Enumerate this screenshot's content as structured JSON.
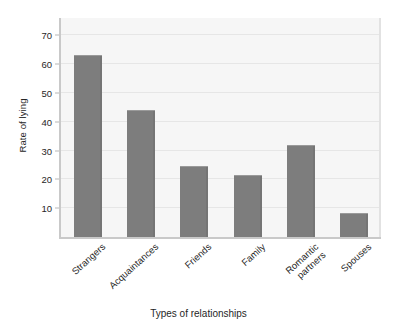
{
  "chart_data": {
    "type": "bar",
    "title": "",
    "subtitle": "",
    "xlabel": "Types of relationships",
    "ylabel": "Rate of lying",
    "categories": [
      "Strangers",
      "Acquaintances",
      "Friends",
      "Family",
      "Romantic partners",
      "Spouses"
    ],
    "values": [
      63,
      44,
      24.5,
      21.5,
      32,
      8.5
    ],
    "ylim": [
      0,
      76
    ],
    "yticks": [
      10,
      20,
      30,
      40,
      50,
      60,
      70
    ],
    "ytick_labels": [
      "10",
      "20",
      "30",
      "40",
      "50",
      "60",
      "70"
    ],
    "grid": true,
    "grid_axis": "y",
    "legend": false,
    "legend_position": "none",
    "bar_color": "#7d7d7d",
    "plot_background": "#f6f6f6",
    "figure_background": "#ffffff",
    "gridline_color": "#e6e6e6",
    "axis_color": "#c9c9c9",
    "xtick_rotation": -42
  }
}
